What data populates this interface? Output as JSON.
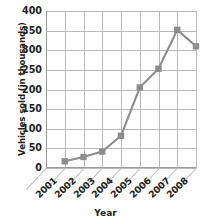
{
  "chart_data": {
    "type": "line",
    "title": "",
    "xlabel": "Year",
    "ylabel": "Vehicles sold (in thousands)",
    "categories": [
      "2001",
      "2002",
      "2003",
      "2004",
      "2005",
      "2006",
      "2007",
      "2008"
    ],
    "x_tick_labels": [
      "2001",
      "2002",
      "2003",
      "2004",
      "2005",
      "2006",
      "2007",
      "2008"
    ],
    "y_tick_labels": [
      "0",
      "50",
      "100",
      "150",
      "200",
      "250",
      "300",
      "350",
      "400"
    ],
    "y_ticks": [
      0,
      50,
      100,
      150,
      200,
      250,
      300,
      350,
      400
    ],
    "ylim": [
      0,
      400
    ],
    "grid": true,
    "legend": "none",
    "series": [
      {
        "name": "Vehicles sold",
        "color": "#8c8c8c",
        "marker": "square",
        "points": [
          {
            "x": "2002",
            "y": 17
          },
          {
            "x": "2003",
            "y": 28
          },
          {
            "x": "2004",
            "y": 42
          },
          {
            "x": "2005",
            "y": 82
          },
          {
            "x": "2006",
            "y": 205
          },
          {
            "x": "2007",
            "y": 253
          },
          {
            "x": "2008",
            "y": 352
          },
          {
            "x": "2009",
            "y": 310
          }
        ]
      }
    ],
    "colors": {
      "line": "#8c8c8c",
      "marker": "#8c8c8c",
      "grid": "#b9b9b9",
      "axis": "#9a9a9a",
      "text": "#231f20",
      "background": "#ffffff"
    }
  }
}
